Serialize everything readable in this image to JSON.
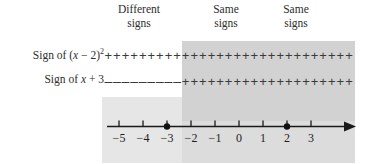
{
  "figure": {
    "headers": [
      {
        "line1": "Different",
        "line2": "signs"
      },
      {
        "line1": "Same",
        "line2": "signs"
      },
      {
        "line1": "Same",
        "line2": "signs"
      }
    ],
    "rows": [
      {
        "label_prefix": "Sign of (",
        "label_var": "x",
        "label_mid": " − 2)",
        "label_exp": "2",
        "label_suffix": "",
        "left_signs": "+++++++++",
        "right_signs": "++++++++++++++++++++",
        "left_sign_char": "+",
        "right_sign_char": "+",
        "left_count": 9,
        "right_count": 20
      },
      {
        "label_prefix": "Sign of ",
        "label_var": "x",
        "label_mid": " + 3",
        "label_exp": "",
        "label_suffix": "",
        "left_signs": "---------",
        "right_signs": "++++++++++++++++++++",
        "left_sign_char": "–",
        "right_sign_char": "+",
        "left_count": 9,
        "right_count": 20
      }
    ],
    "colors": {
      "band_light": "#e6e6e6",
      "band_dark": "#d2d2d2",
      "axis": "#1a1a1a",
      "text": "#2e2e2e"
    }
  },
  "chart_data": {
    "type": "line",
    "xlabel": "x",
    "ylabel": "",
    "xlim": [
      -5.6,
      3.9
    ],
    "grid": false,
    "legend": "none",
    "axis": {
      "ticks": [
        -5,
        -4,
        -3,
        -2,
        -1,
        0,
        1,
        2,
        3
      ],
      "tick_labels": [
        "−5",
        "−4",
        "−3",
        "−2",
        "−1",
        "0",
        "1",
        "2",
        "3"
      ],
      "arrow_right": true,
      "unit_px": 24,
      "x_origin_value": 0
    },
    "critical_points": [
      {
        "value": -3,
        "label": "−3",
        "marker": "filled-dot"
      },
      {
        "value": 2,
        "label": "2",
        "marker": "filled-dot"
      }
    ],
    "series": [
      {
        "name": "Sign of (x - 2)^2",
        "intervals": [
          {
            "from": -5.6,
            "to": -3,
            "sign": "+"
          },
          {
            "from": -3,
            "to": 3.9,
            "sign": "+"
          }
        ]
      },
      {
        "name": "Sign of x + 3",
        "intervals": [
          {
            "from": -5.6,
            "to": -3,
            "sign": "-"
          },
          {
            "from": -3,
            "to": 3.9,
            "sign": "+"
          }
        ]
      }
    ],
    "annotations": [
      {
        "text": "Different signs",
        "x_center": -4.4
      },
      {
        "text": "Same signs",
        "x_center": -0.6
      },
      {
        "text": "Same signs",
        "x_center": 2.3
      }
    ],
    "shaded_regions": [
      {
        "name": "same-signs-region",
        "from": -3,
        "to": 3.9,
        "color": "#d2d2d2"
      }
    ]
  }
}
